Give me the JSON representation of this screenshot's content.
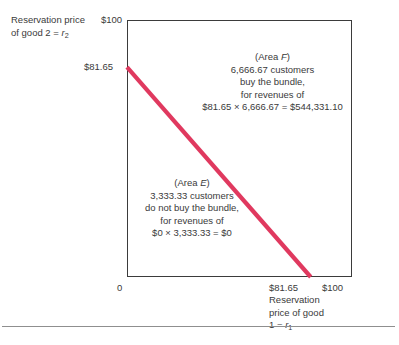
{
  "chart_data": {
    "type": "line",
    "title": "",
    "xlabel": "Reservation price of good 1 = r1",
    "ylabel": "Reservation price of good 2 = r2",
    "xlim": [
      0,
      100
    ],
    "ylim": [
      0,
      100
    ],
    "grid": false,
    "legend": "none",
    "x": [
      0,
      81.65
    ],
    "y": [
      81.65,
      0
    ],
    "series": [
      {
        "name": "bundle reservation price frontier",
        "x": [
          0,
          81.65
        ],
        "values": [
          81.65,
          0
        ],
        "color": "#e0395f"
      }
    ],
    "xticks": [
      {
        "value": 0,
        "label": "0"
      },
      {
        "value": 81.65,
        "label": "$81.65"
      },
      {
        "value": 100,
        "label": "$100"
      }
    ],
    "yticks": [
      {
        "value": 81.65,
        "label": "$81.65"
      },
      {
        "value": 100,
        "label": "$100"
      }
    ],
    "annotations": [
      {
        "id": "area-f",
        "head": "(Area F)",
        "lines": [
          "6,666.67 customers",
          "buy the bundle,",
          "for revenues of",
          "$81.65 × 6,666.67 = $544,331.10"
        ],
        "customers": 6666.67,
        "price": 81.65,
        "revenue": 544331.1,
        "region": "above-right of line"
      },
      {
        "id": "area-e",
        "head": "(Area E)",
        "lines": [
          "3,333.33 customers",
          "do not buy the bundle,",
          "for revenues of",
          "$0 × 3,333.33 = $0"
        ],
        "customers": 3333.33,
        "price": 0,
        "revenue": 0,
        "region": "below-left of line"
      }
    ]
  },
  "axes": {
    "y_title_line1": "Reservation price",
    "y_title_line2": "of good  2 = ",
    "y_title_var": "r",
    "y_title_sub": "2",
    "y_tick_top": "$100",
    "y_tick_mid": "$81.65",
    "origin": "0",
    "x_tick_mid": "$81.65",
    "x_tick_right": "$100",
    "x_title_line1": "Reservation",
    "x_title_line2": "price of good",
    "x_title_line3": "1 = ",
    "x_title_var": "r",
    "x_title_sub": "1"
  },
  "area_f": {
    "head_prefix": "(Area ",
    "head_var": "F",
    "head_suffix": ")",
    "line1": "6,666.67 customers",
    "line2": "buy the bundle,",
    "line3": "for revenues of",
    "line4": "$81.65 × 6,666.67 = $544,331.10"
  },
  "area_e": {
    "head_prefix": "(Area ",
    "head_var": "E",
    "head_suffix": ")",
    "line1": "3,333.33 customers",
    "line2": "do not buy the bundle,",
    "line3": "for revenues of",
    "line4": "$0 × 3,333.33 = $0"
  },
  "style": {
    "line_color": "#e0395f",
    "frame_color": "#3b3b3b",
    "text_color": "#3a3a3a",
    "rule_color": "#8f8f8f"
  }
}
